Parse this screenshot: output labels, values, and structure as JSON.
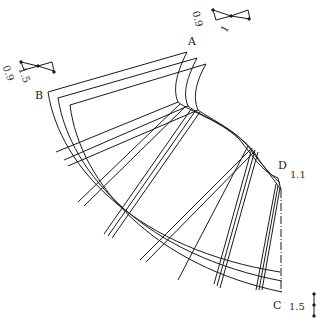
{
  "diagram": {
    "type": "sewing pattern - flared skirt panel",
    "points": {
      "A": "A",
      "B": "B",
      "C": "C",
      "D": "D"
    },
    "annotations": {
      "top_scale_a": "0.9",
      "top_scale_b": "1",
      "left_scale_a": "0.9",
      "left_scale_b": "1.5",
      "d_value": "1.1",
      "c_value": "1.5"
    },
    "colors": {
      "line": "#1a1a1a",
      "background": "#ffffff"
    }
  }
}
